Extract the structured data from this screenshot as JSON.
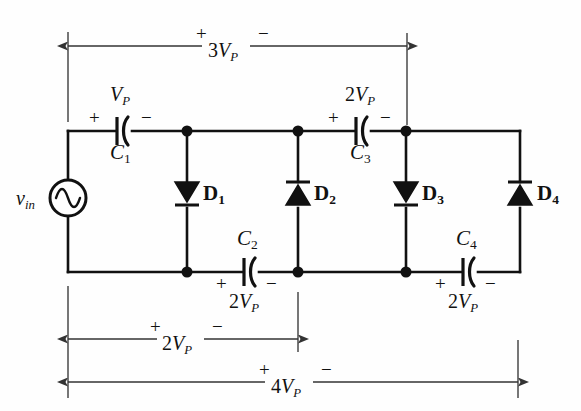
{
  "figure": {
    "background_color": "#fefefe",
    "line_color": "#111111"
  },
  "source": {
    "name": "v_in",
    "label_main": "v",
    "label_sub": "in",
    "symbol": "ac-source-sine"
  },
  "capacitors": [
    {
      "id": "C1",
      "name_main": "C",
      "name_sub": "1",
      "value_main": "V",
      "value_prefix": "",
      "value_sub": "P",
      "plus": "+",
      "minus": "−",
      "orientation": "horizontal",
      "rail": "top"
    },
    {
      "id": "C2",
      "name_main": "C",
      "name_sub": "2",
      "value_main": "V",
      "value_prefix": "2",
      "value_sub": "P",
      "plus": "+",
      "minus": "−",
      "orientation": "horizontal",
      "rail": "bottom"
    },
    {
      "id": "C3",
      "name_main": "C",
      "name_sub": "3",
      "value_main": "V",
      "value_prefix": "2",
      "value_sub": "P",
      "plus": "+",
      "minus": "−",
      "orientation": "horizontal",
      "rail": "top"
    },
    {
      "id": "C4",
      "name_main": "C",
      "name_sub": "4",
      "value_main": "V",
      "value_prefix": "2",
      "value_sub": "P",
      "plus": "+",
      "minus": "−",
      "orientation": "horizontal",
      "rail": "bottom"
    }
  ],
  "diodes": [
    {
      "id": "D1",
      "name_main": "D",
      "name_sub": "1",
      "direction": "down"
    },
    {
      "id": "D2",
      "name_main": "D",
      "name_sub": "2",
      "direction": "up"
    },
    {
      "id": "D3",
      "name_main": "D",
      "name_sub": "3",
      "direction": "down"
    },
    {
      "id": "D4",
      "name_main": "D",
      "name_sub": "4",
      "direction": "up"
    }
  ],
  "measurements": [
    {
      "id": "top-3vp",
      "value_prefix": "3",
      "value_main": "V",
      "value_sub": "P",
      "plus": "+",
      "minus": "−",
      "position": "top",
      "span_from_x": 68,
      "span_to_x": 407
    },
    {
      "id": "bottom-2vp",
      "value_prefix": "2",
      "value_main": "V",
      "value_sub": "P",
      "plus": "+",
      "minus": "−",
      "position": "bottom-upper",
      "span_from_x": 68,
      "span_to_x": 298
    },
    {
      "id": "bottom-4vp",
      "value_prefix": "4",
      "value_main": "V",
      "value_sub": "P",
      "plus": "+",
      "minus": "−",
      "position": "bottom-lower",
      "span_from_x": 68,
      "span_to_x": 518
    }
  ]
}
